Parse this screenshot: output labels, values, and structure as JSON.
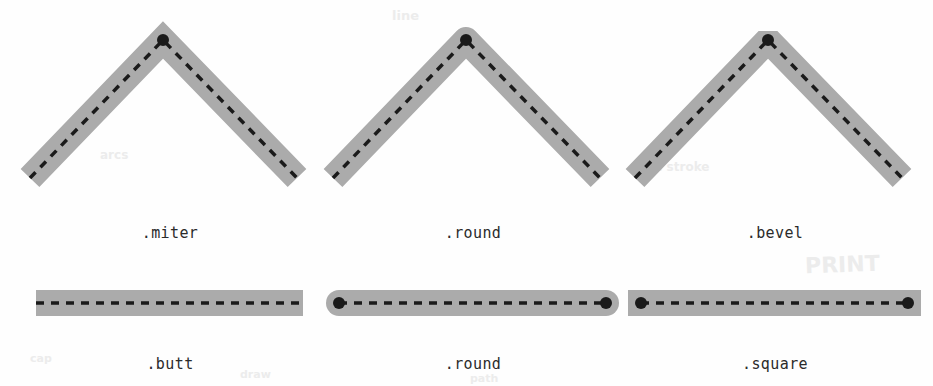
{
  "figure": {
    "background_color": "#fefefe",
    "band_color": "#ababab",
    "path_color": "#1a1a1a",
    "caption_color": "#2b2b2b",
    "band_width": 26,
    "dash_pattern": "8 7",
    "dash_width": 3.5,
    "endpoint_dot_radius": 6
  },
  "rows": [
    {
      "name": "line-join-row",
      "kind": "join",
      "items": [
        {
          "label": ".miter",
          "join": "miter",
          "caption_x": 170,
          "caption_y": 224,
          "apex": {
            "x": 163,
            "y": 40
          },
          "left_end": {
            "x": 30,
            "y": 178
          },
          "right_end": {
            "x": 297,
            "y": 178
          }
        },
        {
          "label": ".round",
          "join": "round",
          "caption_x": 473,
          "caption_y": 224,
          "apex": {
            "x": 466,
            "y": 40
          },
          "left_end": {
            "x": 333,
            "y": 178
          },
          "right_end": {
            "x": 600,
            "y": 178
          }
        },
        {
          "label": ".bevel",
          "join": "bevel",
          "caption_x": 775,
          "caption_y": 224,
          "apex": {
            "x": 768,
            "y": 40
          },
          "left_end": {
            "x": 635,
            "y": 178
          },
          "right_end": {
            "x": 902,
            "y": 178
          }
        }
      ]
    },
    {
      "name": "line-cap-row",
      "kind": "cap",
      "items": [
        {
          "label": ".butt",
          "cap": "butt",
          "caption_x": 170,
          "caption_y": 355,
          "left_end": {
            "x": 36,
            "y": 303
          },
          "right_end": {
            "x": 303,
            "y": 303
          },
          "show_end_dots": false
        },
        {
          "label": ".round",
          "cap": "round",
          "caption_x": 473,
          "caption_y": 355,
          "left_end": {
            "x": 339,
            "y": 303
          },
          "right_end": {
            "x": 606,
            "y": 303
          },
          "show_end_dots": true
        },
        {
          "label": ".square",
          "cap": "square",
          "caption_x": 775,
          "caption_y": 355,
          "left_end": {
            "x": 641,
            "y": 303
          },
          "right_end": {
            "x": 908,
            "y": 303
          },
          "show_end_dots": true
        }
      ]
    }
  ],
  "bleed_artifacts": [
    {
      "text": "PRINT",
      "x": 805,
      "y": 252,
      "size": 22,
      "rotate": -2
    },
    {
      "text": "line",
      "x": 392,
      "y": 8,
      "size": 13,
      "rotate": 0
    },
    {
      "text": "arcs",
      "x": 100,
      "y": 148,
      "size": 12,
      "rotate": 0
    },
    {
      "text": "the stroke",
      "x": 640,
      "y": 160,
      "size": 12,
      "rotate": 0
    },
    {
      "text": "draw",
      "x": 240,
      "y": 368,
      "size": 11,
      "rotate": 0
    },
    {
      "text": "path",
      "x": 470,
      "y": 372,
      "size": 11,
      "rotate": 0
    },
    {
      "text": "cap",
      "x": 30,
      "y": 352,
      "size": 11,
      "rotate": 0
    }
  ]
}
